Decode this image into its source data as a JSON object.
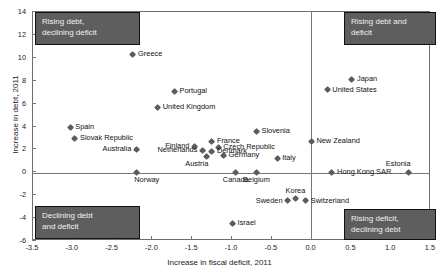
{
  "chart_data": {
    "type": "scatter",
    "title": "",
    "xlabel": "Increase in fiscal deficit, 2011",
    "ylabel": "Increase in debt, 2011",
    "xlim": [
      -3.5,
      1.5
    ],
    "ylim": [
      -6,
      14
    ],
    "xticks": [
      "-3.5",
      "-3.0",
      "-2.5",
      "-2.0",
      "-1.5",
      "-1.0",
      "-0.5",
      "0.0",
      "0.5",
      "1.0",
      "1.5"
    ],
    "xtick_values": [
      -3.5,
      -3.0,
      -2.5,
      -2.0,
      -1.5,
      -1.0,
      -0.5,
      0.0,
      0.5,
      1.0,
      1.5
    ],
    "yticks": [
      "-6",
      "-4",
      "-2",
      "0",
      "2",
      "4",
      "6",
      "8",
      "10",
      "12",
      "14"
    ],
    "ytick_values": [
      -6,
      -4,
      -2,
      0,
      2,
      4,
      6,
      8,
      10,
      12,
      14
    ],
    "grid": false,
    "legend": "none",
    "marker_color": "#5c5c5c",
    "points": [
      {
        "label": "Greece",
        "x": -2.23,
        "y": 10.2,
        "pos": "r"
      },
      {
        "label": "Portugal",
        "x": -1.71,
        "y": 7.0,
        "pos": "r"
      },
      {
        "label": "United Kingdom",
        "x": -1.92,
        "y": 5.6,
        "pos": "r"
      },
      {
        "label": "Japan",
        "x": 0.52,
        "y": 8.0,
        "pos": "r"
      },
      {
        "label": "United States",
        "x": 0.21,
        "y": 7.1,
        "pos": "r"
      },
      {
        "label": "Slovenia",
        "x": -0.68,
        "y": 3.5,
        "pos": "r"
      },
      {
        "label": "New Zealand",
        "x": 0.01,
        "y": 2.6,
        "pos": "r"
      },
      {
        "label": "Spain",
        "x": -3.02,
        "y": 3.8,
        "pos": "r"
      },
      {
        "label": "Slovak Republic",
        "x": -2.96,
        "y": 2.9,
        "pos": "r"
      },
      {
        "label": "France",
        "x": -1.24,
        "y": 2.6,
        "pos": "r"
      },
      {
        "label": "Finland",
        "x": -1.46,
        "y": 2.2,
        "pos": "l"
      },
      {
        "label": "Czech Republic",
        "x": -1.16,
        "y": 2.1,
        "pos": "r"
      },
      {
        "label": "Australia",
        "x": -2.19,
        "y": 1.9,
        "pos": "l"
      },
      {
        "label": "Netherlands",
        "x": -1.36,
        "y": 1.8,
        "pos": "l"
      },
      {
        "label": "Denmark",
        "x": -1.24,
        "y": 1.7,
        "pos": "r"
      },
      {
        "label": "Austria",
        "x": -1.31,
        "y": 1.3,
        "pos": "bl"
      },
      {
        "label": "Germany",
        "x": -1.09,
        "y": 1.4,
        "pos": "r"
      },
      {
        "label": "Italy",
        "x": -0.42,
        "y": 1.1,
        "pos": "r"
      },
      {
        "label": "Norway",
        "x": -2.19,
        "y": -0.1,
        "pos": "br"
      },
      {
        "label": "Canada",
        "x": -0.94,
        "y": -0.1,
        "pos": "b"
      },
      {
        "label": "Belgium",
        "x": -0.68,
        "y": -0.1,
        "pos": "b"
      },
      {
        "label": "Hong Kong SAR",
        "x": 0.27,
        "y": -0.1,
        "pos": "r"
      },
      {
        "label": "Estonia",
        "x": 1.23,
        "y": -0.1,
        "pos": "tl"
      },
      {
        "label": "Sweden",
        "x": -0.29,
        "y": -2.6,
        "pos": "l"
      },
      {
        "label": "Korea",
        "x": -0.19,
        "y": -2.4,
        "pos": "t"
      },
      {
        "label": "Switzerland",
        "x": -0.06,
        "y": -2.6,
        "pos": "r"
      },
      {
        "label": "Israel",
        "x": -0.98,
        "y": -4.6,
        "pos": "r"
      }
    ],
    "annotations": [
      {
        "id": "top-left",
        "lines": [
          "Rising debt,",
          "declining deficit"
        ]
      },
      {
        "id": "top-right",
        "lines": [
          "Rising debt and",
          "deficit"
        ]
      },
      {
        "id": "bottom-left",
        "lines": [
          "Declining debt",
          "and deficit"
        ]
      },
      {
        "id": "bottom-right",
        "lines": [
          "Rising deficit,",
          "declining debt"
        ]
      }
    ]
  }
}
